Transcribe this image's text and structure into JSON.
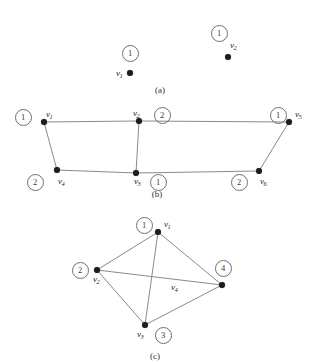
{
  "figure": {
    "background_color": "#ffffff",
    "vertex_color": "#1d1d1d",
    "edge_color": "#8a8a8a",
    "circle_stroke_color": "#6f6f6f",
    "width": 320,
    "height": 362
  },
  "panels": [
    {
      "id": "a",
      "caption": "(a)",
      "caption_x": 160,
      "caption_y": 86,
      "vertices": [
        {
          "name": "v1",
          "label_text": "v",
          "label_sub": "1",
          "x": 130,
          "y": 73,
          "label_x": 116,
          "label_y": 69,
          "circle_value": "1",
          "circle_x": 129,
          "circle_y": 52
        },
        {
          "name": "v2",
          "label_text": "v",
          "label_sub": "2",
          "x": 228,
          "y": 57,
          "label_x": 230,
          "label_y": 41,
          "circle_value": "1",
          "circle_x": 218,
          "circle_y": 32
        }
      ],
      "edges": []
    },
    {
      "id": "b",
      "caption": "(b)",
      "caption_x": 157,
      "caption_y": 190,
      "vertices": [
        {
          "name": "v1",
          "label_text": "v",
          "label_sub": "1",
          "x": 44,
          "y": 122,
          "label_x": 46,
          "label_y": 110,
          "circle_value": "1",
          "circle_x": 22,
          "circle_y": 116
        },
        {
          "name": "v2",
          "label_text": "v",
          "label_sub": "2",
          "x": 139,
          "y": 121,
          "label_x": 133,
          "label_y": 109,
          "circle_value": "2",
          "circle_x": 161,
          "circle_y": 114
        },
        {
          "name": "v3",
          "label_text": "v",
          "label_sub": "3",
          "x": 136,
          "y": 173,
          "label_x": 134,
          "label_y": 177,
          "circle_value": "1",
          "circle_x": 157,
          "circle_y": 181
        },
        {
          "name": "v4",
          "label_text": "v",
          "label_sub": "4",
          "x": 57,
          "y": 170,
          "label_x": 58,
          "label_y": 177,
          "circle_value": "2",
          "circle_x": 34,
          "circle_y": 181
        },
        {
          "name": "v5",
          "label_text": "v",
          "label_sub": "5",
          "x": 289,
          "y": 122,
          "label_x": 295,
          "label_y": 110,
          "circle_value": "1",
          "circle_x": 277,
          "circle_y": 114
        },
        {
          "name": "v6",
          "label_text": "v",
          "label_sub": "6",
          "x": 259,
          "y": 171,
          "label_x": 260,
          "label_y": 177,
          "circle_value": "2",
          "circle_x": 238,
          "circle_y": 181
        }
      ],
      "edges": [
        {
          "from": "v1",
          "to": "v2"
        },
        {
          "from": "v2",
          "to": "v5"
        },
        {
          "from": "v1",
          "to": "v4"
        },
        {
          "from": "v2",
          "to": "v3"
        },
        {
          "from": "v4",
          "to": "v3"
        },
        {
          "from": "v3",
          "to": "v6"
        },
        {
          "from": "v6",
          "to": "v5"
        }
      ]
    },
    {
      "id": "c",
      "caption": "(c)",
      "caption_x": 155,
      "caption_y": 352,
      "vertices": [
        {
          "name": "v1",
          "label_text": "v",
          "label_sub": "1",
          "x": 158,
          "y": 232,
          "label_x": 164,
          "label_y": 220,
          "circle_value": "1",
          "circle_x": 143,
          "circle_y": 224
        },
        {
          "name": "v2",
          "label_text": "v",
          "label_sub": "2",
          "x": 97,
          "y": 270,
          "label_x": 93,
          "label_y": 275,
          "circle_value": "2",
          "circle_x": 79,
          "circle_y": 269
        },
        {
          "name": "v3",
          "label_text": "v",
          "label_sub": "3",
          "x": 145,
          "y": 325,
          "label_x": 137,
          "label_y": 330,
          "circle_value": "3",
          "circle_x": 162,
          "circle_y": 334
        },
        {
          "name": "v4",
          "label_text": "v",
          "label_sub": "4",
          "x": 222,
          "y": 285,
          "label_x": 171,
          "label_y": 283,
          "circle_value": "4",
          "circle_x": 222,
          "circle_y": 267
        }
      ],
      "edges": [
        {
          "from": "v1",
          "to": "v2"
        },
        {
          "from": "v1",
          "to": "v4"
        },
        {
          "from": "v1",
          "to": "v3"
        },
        {
          "from": "v2",
          "to": "v3"
        },
        {
          "from": "v2",
          "to": "v4"
        },
        {
          "from": "v3",
          "to": "v4"
        }
      ]
    }
  ]
}
